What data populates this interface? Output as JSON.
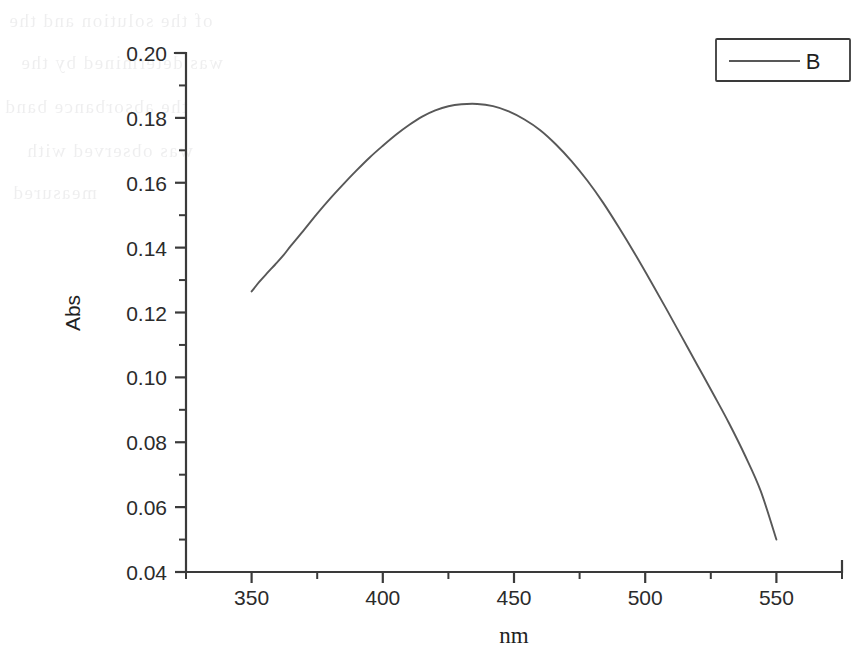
{
  "chart_data": {
    "type": "line",
    "title": "",
    "xlabel": "nm",
    "ylabel": "Abs",
    "xlim": [
      325,
      575
    ],
    "ylim": [
      0.04,
      0.2
    ],
    "grid": false,
    "legend_position": "top-right",
    "x_ticks": [
      350,
      400,
      450,
      500,
      550
    ],
    "x_tick_labels": [
      "350",
      "400",
      "450",
      "500",
      "550"
    ],
    "x_minor_ticks": [
      325,
      375,
      425,
      475,
      525,
      575
    ],
    "y_ticks": [
      0.04,
      0.06,
      0.08,
      0.1,
      0.12,
      0.14,
      0.16,
      0.18,
      0.2
    ],
    "y_tick_labels": [
      "0.04",
      "0.06",
      "0.08",
      "0.10",
      "0.12",
      "0.14",
      "0.16",
      "0.18",
      "0.20"
    ],
    "y_minor_ticks": [
      0.05,
      0.07,
      0.09,
      0.11,
      0.13,
      0.15,
      0.17,
      0.19
    ],
    "peak": {
      "x": 436,
      "y": 0.1843
    },
    "series": [
      {
        "name": "B",
        "color": "#585858",
        "x": [
          350,
          353,
          356,
          359,
          362,
          365,
          370,
          375,
          380,
          385,
          390,
          395,
          400,
          405,
          410,
          415,
          420,
          425,
          430,
          436,
          442,
          448,
          454,
          460,
          466,
          472,
          478,
          484,
          490,
          496,
          502,
          508,
          514,
          520,
          526,
          532,
          538,
          544,
          550
        ],
        "y": [
          0.1265,
          0.1295,
          0.1322,
          0.1348,
          0.1375,
          0.1406,
          0.1455,
          0.1505,
          0.1552,
          0.1596,
          0.1638,
          0.1678,
          0.1714,
          0.1748,
          0.1778,
          0.1804,
          0.1823,
          0.1836,
          0.1842,
          0.1843,
          0.1836,
          0.182,
          0.1795,
          0.1762,
          0.1718,
          0.1666,
          0.1606,
          0.1538,
          0.1462,
          0.1382,
          0.1298,
          0.1212,
          0.1124,
          0.1036,
          0.0948,
          0.0858,
          0.076,
          0.065,
          0.05
        ]
      }
    ],
    "legend_entries": [
      {
        "label": "B",
        "color": "#585858"
      }
    ]
  },
  "legend": {
    "entry_label": "B"
  },
  "axes": {
    "x_title": "nm",
    "y_title": "Abs"
  },
  "ghost_text": {
    "lines": [
      "of the solution and the",
      "was determined by the",
      "the absorbance band",
      "was observed with",
      "measured"
    ]
  }
}
